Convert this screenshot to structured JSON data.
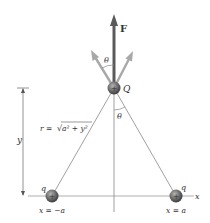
{
  "diagram": {
    "force_label": "F",
    "charge_top_label": "Q",
    "angle_top_label": "θ",
    "angle_bottom_label": "θ",
    "distance_label": "r = √(a² + y²)",
    "distance_label_r": "r = ",
    "distance_label_sqrt": "√",
    "distance_label_body": "a² + y²",
    "height_label": "y",
    "axis_label": "x",
    "left_charge_label": "q",
    "right_charge_label": "q",
    "left_position_label": "x = −a",
    "right_position_label": "x = a",
    "charge_sign": "+",
    "colors": {
      "force_arrow": "#555555",
      "component_arrows": "#a8a8a8",
      "charge_fill": "#6a6a6a",
      "lines": "#888888",
      "text": "#333333"
    }
  }
}
